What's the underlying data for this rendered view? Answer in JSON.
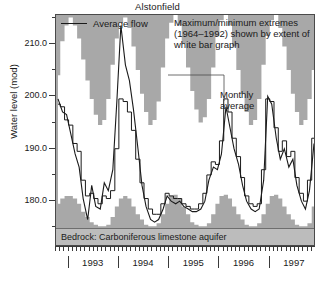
{
  "chart_data": {
    "type": "area",
    "title": "Alstonfield",
    "xlabel": "",
    "ylabel": "Water level (mod)",
    "ylim": [
      174.5,
      215.5
    ],
    "yticks": [
      180.0,
      190.0,
      200.0,
      210.0
    ],
    "ytick_labels": [
      "180.0",
      "190.0",
      "200.0",
      "210.0"
    ],
    "yminor_step": 5,
    "grid": false,
    "xlim": [
      1992.75,
      1997.92
    ],
    "xticks": [
      1993,
      1994,
      1995,
      1996,
      1997
    ],
    "xtick_labels": [
      "1993",
      "1994",
      "1995",
      "1996",
      "1997"
    ],
    "x_minor_interval": "monthly",
    "legend": [
      {
        "name": "Average flow",
        "marker": "line",
        "color": "#1a1a1a"
      }
    ],
    "annotations": [
      {
        "name": "extremes-note",
        "text": "Maximum/minimum extremes (1964–1992) shown by extent of white bar graph"
      },
      {
        "name": "monthly-average-note",
        "text": "Monthly average"
      },
      {
        "name": "bedrock-note",
        "text": "Bedrock: Carboniferous limestone aquifer"
      }
    ],
    "colors": {
      "background_gray": "#a8a8a8",
      "envelope_white": "#ffffff",
      "line": "#1a1a1a",
      "bedrock_band": "#bcbcbc",
      "axis": "#3a3a3a"
    },
    "series": [
      {
        "name": "Maximum extreme (1964-1992)",
        "role": "envelope_upper",
        "step": true,
        "x": [
          1992.79,
          1992.88,
          1992.96,
          1993.04,
          1993.13,
          1993.21,
          1993.29,
          1993.38,
          1993.46,
          1993.54,
          1993.63,
          1993.71,
          1993.79,
          1993.88,
          1993.96,
          1994.04,
          1994.13,
          1994.21,
          1994.29,
          1994.38,
          1994.46,
          1994.54,
          1994.63,
          1994.71,
          1994.79,
          1994.88,
          1994.96,
          1995.04,
          1995.13,
          1995.21,
          1995.29,
          1995.38,
          1995.46,
          1995.54,
          1995.63,
          1995.71,
          1995.79,
          1995.88,
          1995.96,
          1996.04,
          1996.13,
          1996.21,
          1996.29,
          1996.38,
          1996.46,
          1996.54,
          1996.63,
          1996.71,
          1996.79,
          1996.88,
          1996.96,
          1997.04,
          1997.13,
          1997.21,
          1997.29,
          1997.38,
          1997.46,
          1997.54,
          1997.63,
          1997.71,
          1997.79,
          1997.88
        ],
        "values": [
          204.0,
          210.5,
          213.5,
          215.0,
          213.5,
          211.0,
          207.0,
          203.0,
          199.5,
          196.5,
          194.5,
          195.5,
          199.5,
          206.0,
          211.0,
          214.0,
          215.0,
          213.0,
          209.5,
          205.0,
          200.5,
          197.0,
          194.5,
          195.5,
          199.0,
          205.5,
          211.0,
          214.0,
          215.5,
          213.5,
          210.0,
          205.5,
          201.0,
          197.5,
          195.0,
          196.0,
          199.5,
          205.5,
          211.5,
          214.5,
          215.5,
          213.5,
          209.5,
          205.0,
          200.5,
          197.0,
          194.5,
          195.5,
          199.5,
          206.0,
          211.5,
          214.5,
          215.5,
          213.0,
          209.5,
          205.0,
          200.5,
          197.0,
          194.5,
          195.5,
          199.5,
          205.0
        ]
      },
      {
        "name": "Minimum extreme (1964-1992)",
        "role": "envelope_lower",
        "step": true,
        "x": [
          1992.79,
          1992.88,
          1992.96,
          1993.04,
          1993.13,
          1993.21,
          1993.29,
          1993.38,
          1993.46,
          1993.54,
          1993.63,
          1993.71,
          1993.79,
          1993.88,
          1993.96,
          1994.04,
          1994.13,
          1994.21,
          1994.29,
          1994.38,
          1994.46,
          1994.54,
          1994.63,
          1994.71,
          1994.79,
          1994.88,
          1994.96,
          1995.04,
          1995.13,
          1995.21,
          1995.29,
          1995.38,
          1995.46,
          1995.54,
          1995.63,
          1995.71,
          1995.79,
          1995.88,
          1995.96,
          1996.04,
          1996.13,
          1996.21,
          1996.29,
          1996.38,
          1996.46,
          1996.54,
          1996.63,
          1996.71,
          1996.79,
          1996.88,
          1996.96,
          1997.04,
          1997.13,
          1997.21,
          1997.29,
          1997.38,
          1997.46,
          1997.54,
          1997.63,
          1997.71,
          1997.79,
          1997.88
        ],
        "values": [
          179.5,
          180.5,
          181.0,
          181.0,
          180.5,
          179.5,
          178.0,
          177.0,
          176.0,
          175.5,
          175.2,
          175.2,
          175.5,
          177.0,
          179.0,
          180.5,
          181.0,
          180.5,
          179.0,
          177.5,
          176.5,
          175.5,
          175.2,
          175.2,
          175.8,
          177.5,
          179.5,
          181.0,
          181.2,
          180.5,
          179.0,
          177.5,
          176.0,
          175.5,
          175.2,
          175.2,
          175.8,
          177.5,
          179.5,
          181.0,
          181.2,
          180.5,
          179.0,
          177.5,
          176.5,
          175.5,
          175.2,
          175.2,
          175.8,
          177.5,
          179.5,
          181.0,
          181.2,
          180.5,
          179.0,
          177.5,
          176.5,
          175.5,
          175.2,
          175.2,
          175.8,
          179.0
        ]
      },
      {
        "name": "Average flow",
        "role": "line_smooth",
        "step": false,
        "x": [
          1992.79,
          1992.88,
          1992.96,
          1993.04,
          1993.13,
          1993.21,
          1993.29,
          1993.38,
          1993.46,
          1993.54,
          1993.63,
          1993.71,
          1993.79,
          1993.88,
          1993.96,
          1994.04,
          1994.13,
          1994.21,
          1994.29,
          1994.38,
          1994.46,
          1994.54,
          1994.63,
          1994.71,
          1994.79,
          1994.88,
          1994.96,
          1995.04,
          1995.13,
          1995.21,
          1995.29,
          1995.38,
          1995.46,
          1995.54,
          1995.63,
          1995.71,
          1995.79,
          1995.88,
          1995.96,
          1996.04,
          1996.13,
          1996.21,
          1996.29,
          1996.38,
          1996.46,
          1996.54,
          1996.63,
          1996.71,
          1996.79,
          1996.88,
          1996.96,
          1997.04,
          1997.13,
          1997.21,
          1997.29,
          1997.38,
          1997.46,
          1997.54,
          1997.63,
          1997.71,
          1997.79,
          1997.88
        ],
        "values": [
          199.5,
          197.0,
          196.5,
          193.0,
          189.0,
          186.5,
          180.5,
          176.5,
          183.0,
          179.0,
          178.5,
          183.5,
          182.0,
          186.0,
          199.0,
          213.5,
          206.0,
          203.0,
          197.5,
          190.0,
          183.0,
          179.0,
          176.5,
          176.0,
          176.5,
          178.5,
          181.0,
          180.0,
          179.5,
          180.0,
          179.0,
          178.5,
          178.0,
          178.0,
          178.5,
          180.0,
          184.0,
          186.5,
          186.0,
          189.0,
          198.0,
          194.0,
          190.0,
          187.0,
          183.0,
          180.0,
          178.5,
          178.0,
          178.5,
          184.0,
          200.0,
          198.5,
          192.0,
          188.0,
          190.0,
          186.5,
          188.0,
          183.0,
          180.0,
          178.5,
          182.0,
          191.0
        ]
      },
      {
        "name": "Monthly average",
        "role": "line_step",
        "step": true,
        "x": [
          1992.79,
          1992.88,
          1992.96,
          1993.04,
          1993.13,
          1993.21,
          1993.29,
          1993.38,
          1993.46,
          1993.54,
          1993.63,
          1993.71,
          1993.79,
          1993.88,
          1993.96,
          1994.04,
          1994.13,
          1994.21,
          1994.29,
          1994.38,
          1994.46,
          1994.54,
          1994.63,
          1994.71,
          1994.79,
          1994.88,
          1994.96,
          1995.04,
          1995.13,
          1995.21,
          1995.29,
          1995.38,
          1995.46,
          1995.54,
          1995.63,
          1995.71,
          1995.79,
          1995.88,
          1995.96,
          1996.04,
          1996.13,
          1996.21,
          1996.29,
          1996.38,
          1996.46,
          1996.54,
          1996.63,
          1996.71,
          1996.79,
          1996.88,
          1996.96,
          1997.04,
          1997.13,
          1997.21,
          1997.29,
          1997.38,
          1997.46,
          1997.54,
          1997.63,
          1997.71,
          1997.79,
          1997.88
        ],
        "values": [
          198.5,
          198.0,
          195.5,
          194.5,
          191.0,
          189.5,
          184.0,
          181.0,
          181.5,
          180.5,
          179.5,
          181.0,
          180.5,
          182.0,
          190.0,
          199.5,
          199.0,
          197.0,
          193.5,
          188.0,
          183.5,
          180.5,
          178.5,
          177.5,
          177.5,
          179.5,
          181.5,
          181.0,
          180.5,
          180.5,
          179.5,
          179.0,
          178.5,
          178.5,
          179.5,
          181.5,
          185.0,
          187.5,
          187.0,
          191.5,
          199.5,
          197.0,
          192.0,
          188.5,
          184.5,
          181.0,
          179.5,
          179.0,
          179.5,
          186.0,
          199.5,
          199.0,
          194.0,
          189.5,
          191.5,
          188.5,
          189.5,
          184.5,
          181.5,
          180.0,
          184.0,
          192.0
        ]
      }
    ]
  }
}
